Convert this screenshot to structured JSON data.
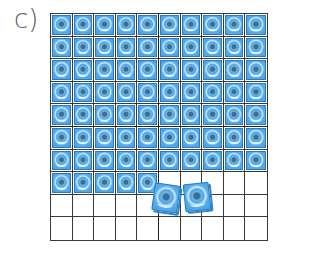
{
  "label": "c)",
  "grid": {
    "rows": 10,
    "cols": 10,
    "filled_in_grid": 75,
    "loose_cubes": 2,
    "total_cubes": 77,
    "fill_color": "#4ea6e4",
    "line_color": "#3a3a3a"
  }
}
